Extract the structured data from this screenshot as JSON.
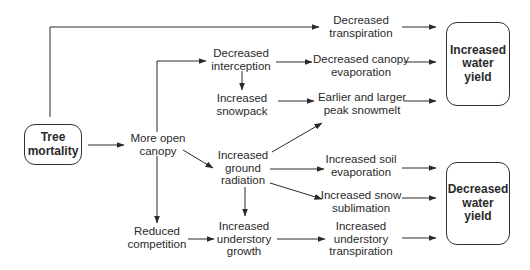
{
  "diagram": {
    "type": "flowchart",
    "nodes": {
      "tree_mortality": {
        "lines": [
          "Tree",
          "mortality"
        ],
        "boxed": true
      },
      "more_open_canopy": {
        "lines": [
          "More open",
          "canopy"
        ]
      },
      "decreased_transpiration": {
        "lines": [
          "Decreased",
          "transpiration"
        ]
      },
      "decreased_interception": {
        "lines": [
          "Decreased",
          "interception"
        ]
      },
      "decreased_canopy_evaporation": {
        "lines": [
          "Decreased canopy",
          "evaporation"
        ]
      },
      "increased_snowpack": {
        "lines": [
          "Increased",
          "snowpack"
        ]
      },
      "earlier_larger_peak_snowmelt": {
        "lines": [
          "Earlier and larger",
          "peak snowmelt"
        ]
      },
      "increased_ground_radiation": {
        "lines": [
          "Increased",
          "ground",
          "radiation"
        ]
      },
      "increased_soil_evaporation": {
        "lines": [
          "Increased soil",
          "evaporation"
        ]
      },
      "increased_snow_sublimation": {
        "lines": [
          "Increased snow",
          "sublimation"
        ]
      },
      "reduced_competition": {
        "lines": [
          "Reduced",
          "competition"
        ]
      },
      "increased_understory_growth": {
        "lines": [
          "Increased",
          "understory",
          "growth"
        ]
      },
      "increased_understory_transpiration": {
        "lines": [
          "Increased",
          "understory",
          "transpiration"
        ]
      },
      "increased_water_yield": {
        "lines": [
          "Increased",
          "water",
          "yield"
        ],
        "boxed": true
      },
      "decreased_water_yield": {
        "lines": [
          "Decreased",
          "water",
          "yield"
        ],
        "boxed": true
      }
    },
    "edges": [
      [
        "tree_mortality",
        "decreased_transpiration"
      ],
      [
        "tree_mortality",
        "more_open_canopy"
      ],
      [
        "more_open_canopy",
        "decreased_interception"
      ],
      [
        "more_open_canopy",
        "increased_ground_radiation"
      ],
      [
        "more_open_canopy",
        "reduced_competition"
      ],
      [
        "decreased_interception",
        "increased_snowpack"
      ],
      [
        "decreased_interception",
        "decreased_canopy_evaporation"
      ],
      [
        "increased_snowpack",
        "earlier_larger_peak_snowmelt"
      ],
      [
        "increased_ground_radiation",
        "earlier_larger_peak_snowmelt"
      ],
      [
        "increased_ground_radiation",
        "increased_soil_evaporation"
      ],
      [
        "increased_ground_radiation",
        "increased_snow_sublimation"
      ],
      [
        "increased_ground_radiation",
        "increased_understory_growth"
      ],
      [
        "reduced_competition",
        "increased_understory_growth"
      ],
      [
        "increased_understory_growth",
        "increased_understory_transpiration"
      ],
      [
        "decreased_transpiration",
        "increased_water_yield"
      ],
      [
        "decreased_canopy_evaporation",
        "increased_water_yield"
      ],
      [
        "earlier_larger_peak_snowmelt",
        "increased_water_yield"
      ],
      [
        "increased_soil_evaporation",
        "decreased_water_yield"
      ],
      [
        "increased_snow_sublimation",
        "decreased_water_yield"
      ],
      [
        "increased_understory_transpiration",
        "decreased_water_yield"
      ]
    ]
  }
}
